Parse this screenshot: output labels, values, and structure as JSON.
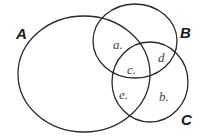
{
  "diagram": {
    "type": "venn",
    "sets": [
      {
        "id": "A",
        "label": "A",
        "shape": {
          "cx": 84,
          "cy": 74,
          "rx": 66,
          "ry": 58
        },
        "label_pos": {
          "x": 16,
          "y": 39
        }
      },
      {
        "id": "B",
        "label": "B",
        "shape": {
          "cx": 135,
          "cy": 41,
          "rx": 42,
          "ry": 37
        },
        "label_pos": {
          "x": 180,
          "y": 38
        }
      },
      {
        "id": "C",
        "label": "C",
        "shape": {
          "cx": 150,
          "cy": 82,
          "rx": 38,
          "ry": 40
        },
        "label_pos": {
          "x": 181,
          "y": 125
        }
      }
    ],
    "regions": [
      {
        "label": "a.",
        "x": 113,
        "y": 49
      },
      {
        "label": "c.",
        "x": 127,
        "y": 74
      },
      {
        "label": "d",
        "x": 158,
        "y": 62
      },
      {
        "label": "e.",
        "x": 119,
        "y": 99
      },
      {
        "label": "b.",
        "x": 159,
        "y": 101
      }
    ],
    "stroke_color": "#2a2a2a"
  }
}
